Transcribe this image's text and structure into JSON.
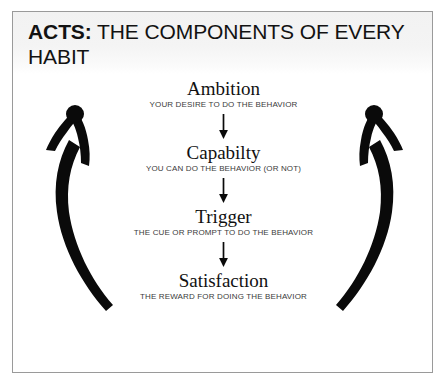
{
  "poster": {
    "title_bold": "ACTS:",
    "title_rest": " THE COMPONENTS OF EVERY HABIT"
  },
  "diagram": {
    "type": "cycle",
    "steps": [
      {
        "name": "Ambition",
        "caption": "YOUR DESIRE TO DO THE BEHAVIOR"
      },
      {
        "name": "Capabilty",
        "caption": "YOU CAN DO THE BEHAVIOR (OR NOT)"
      },
      {
        "name": "Trigger",
        "caption": "THE CUE OR PROMPT TO DO THE BEHAVIOR"
      },
      {
        "name": "Satisfaction",
        "caption": "THE REWARD FOR DOING THE BEHAVIOR"
      }
    ],
    "loop_arrows": [
      {
        "side": "left",
        "direction": "upward"
      },
      {
        "side": "right",
        "direction": "upward"
      }
    ],
    "colors": {
      "ink": "#111111",
      "caption": "#3b3b3b",
      "frame": "#9a9a9a",
      "title_band": "#f2f2f2",
      "background": "#ffffff"
    }
  }
}
